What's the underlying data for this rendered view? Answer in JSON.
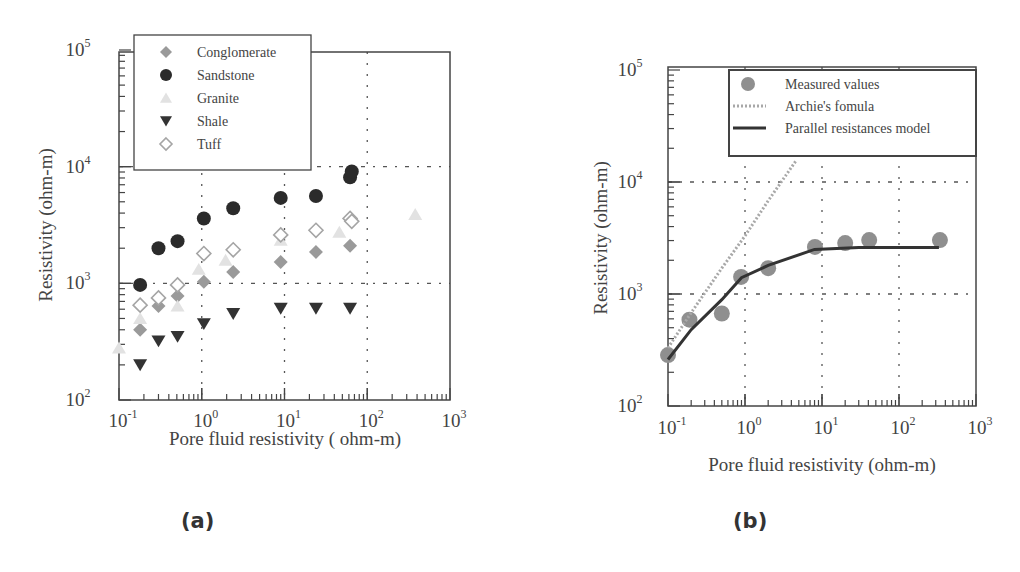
{
  "figure": {
    "panel_a_label": "(a)",
    "panel_b_label": "(b)"
  },
  "chart_data": [
    {
      "id": "a",
      "type": "scatter",
      "title": "",
      "xlabel": "Pore fluid resistivity ( ohm-m)",
      "ylabel": "Resistivity (ohm-m)",
      "xscale": "log",
      "yscale": "log",
      "xlim": [
        0.1,
        1000
      ],
      "ylim": [
        100,
        100000
      ],
      "xticks": [
        {
          "base": "10",
          "exp": "-1"
        },
        {
          "base": "10",
          "exp": "0"
        },
        {
          "base": "10",
          "exp": "1"
        },
        {
          "base": "10",
          "exp": "2"
        },
        {
          "base": "10",
          "exp": "3"
        }
      ],
      "yticks": [
        {
          "base": "10",
          "exp": "2"
        },
        {
          "base": "10",
          "exp": "3"
        },
        {
          "base": "10",
          "exp": "4"
        },
        {
          "base": "10",
          "exp": "5"
        }
      ],
      "grid": "dotted at 10^0, 10^1, 10^2 (x) and 10^3, 10^4 (y)",
      "legend_position": "upper left (overlapping top)",
      "series": [
        {
          "name": "Conglomerate",
          "marker": "diamond-filled",
          "color": "#9a9a9a",
          "x": [
            0.18,
            0.3,
            0.51,
            1.06,
            2.4,
            9.0,
            24,
            62
          ],
          "y": [
            400,
            640,
            780,
            1030,
            1250,
            1520,
            1860,
            2100
          ]
        },
        {
          "name": "Sandstone",
          "marker": "circle-filled",
          "color": "#2b2b2b",
          "x": [
            0.18,
            0.3,
            0.51,
            1.06,
            2.4,
            9.0,
            24,
            62,
            65
          ],
          "y": [
            970,
            2000,
            2300,
            3600,
            4400,
            5400,
            5600,
            8100,
            9100
          ]
        },
        {
          "name": "Granite",
          "marker": "triangle-up-filled",
          "color": "#e2e2e2",
          "x": [
            0.1,
            0.18,
            0.51,
            0.92,
            1.94,
            9.0,
            46,
            380
          ],
          "y": [
            280,
            500,
            640,
            1320,
            1580,
            2350,
            2750,
            3900
          ]
        },
        {
          "name": "Shale",
          "marker": "triangle-down-filled",
          "color": "#333333",
          "x": [
            0.18,
            0.3,
            0.51,
            1.06,
            2.4,
            9.0,
            24,
            62
          ],
          "y": [
            200,
            320,
            350,
            450,
            550,
            610,
            610,
            610
          ]
        },
        {
          "name": "Tuff",
          "marker": "diamond-open",
          "color": "#a5a5a5",
          "x": [
            0.18,
            0.3,
            0.51,
            1.06,
            2.4,
            9.0,
            24,
            62,
            65
          ],
          "y": [
            650,
            750,
            970,
            1800,
            1940,
            2600,
            2850,
            3600,
            3400
          ]
        }
      ]
    },
    {
      "id": "b",
      "type": "scatter",
      "title": "",
      "xlabel": "Pore fluid resistivity (ohm-m)",
      "ylabel": "Resistivity (ohm-m)",
      "xscale": "log",
      "yscale": "log",
      "xlim": [
        0.1,
        1000
      ],
      "ylim": [
        100,
        100000
      ],
      "xticks": [
        {
          "base": "10",
          "exp": "-1"
        },
        {
          "base": "10",
          "exp": "0"
        },
        {
          "base": "10",
          "exp": "1"
        },
        {
          "base": "10",
          "exp": "2"
        },
        {
          "base": "10",
          "exp": "3"
        }
      ],
      "yticks": [
        {
          "base": "10",
          "exp": "2"
        },
        {
          "base": "10",
          "exp": "3"
        },
        {
          "base": "10",
          "exp": "4"
        },
        {
          "base": "10",
          "exp": "5"
        }
      ],
      "grid": "dotted at 10^0, 10^1, 10^2 (x) and 10^3, 10^4 (y)",
      "legend_position": "upper right",
      "series": [
        {
          "name": "Measured values",
          "kind": "points",
          "marker": "circle-filled",
          "color": "#8f8f8f",
          "x": [
            0.1,
            0.19,
            0.5,
            0.89,
            2.0,
            8.1,
            20,
            41,
            340
          ],
          "y": [
            285,
            590,
            670,
            1420,
            1700,
            2630,
            2850,
            3030,
            3030
          ]
        },
        {
          "name": "Archie's fomula",
          "kind": "line",
          "style": "dotted",
          "color": "#a8a8a8",
          "x": [
            0.1,
            0.2,
            0.5,
            1.0,
            2.0,
            4.6
          ],
          "y": [
            330,
            680,
            1700,
            3300,
            6800,
            15500
          ]
        },
        {
          "name": "Parallel resistances model",
          "kind": "line",
          "style": "solid",
          "color": "#333333",
          "x": [
            0.1,
            0.2,
            0.5,
            0.9,
            2.0,
            8.0,
            30,
            330
          ],
          "y": [
            260,
            480,
            890,
            1400,
            1800,
            2500,
            2600,
            2600
          ]
        }
      ]
    }
  ]
}
